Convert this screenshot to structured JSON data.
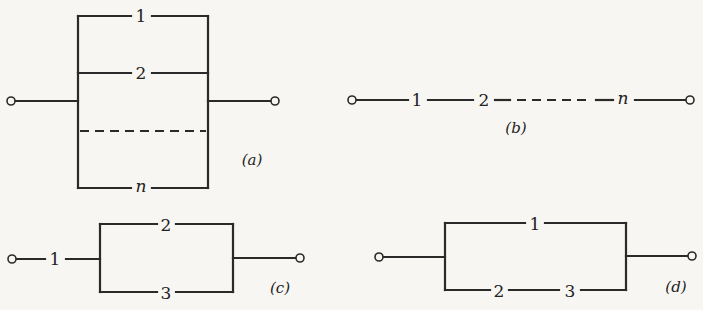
{
  "figure": {
    "panels": [
      {
        "id": "a",
        "caption": "(a)",
        "type": "parallel",
        "branches": [
          "1",
          "2",
          "dashed-continuation",
          "n"
        ]
      },
      {
        "id": "b",
        "caption": "(b)",
        "type": "series",
        "elements": [
          "1",
          "2",
          "dashed-continuation",
          "n"
        ]
      },
      {
        "id": "c",
        "caption": "(c)",
        "type": "series-parallel",
        "series_element": "1",
        "parallel_branches": [
          "2",
          "3"
        ]
      },
      {
        "id": "d",
        "caption": "(d)",
        "type": "parallel-series",
        "parallel_branches": [
          [
            "1"
          ],
          [
            "2",
            "3"
          ]
        ]
      }
    ]
  },
  "labels": {
    "a": {
      "b1": "1",
      "b2": "2",
      "bn": "n",
      "cap": "(a)"
    },
    "b": {
      "e1": "1",
      "e2": "2",
      "en": "n",
      "cap": "(b)"
    },
    "c": {
      "s1": "1",
      "p2": "2",
      "p3": "3",
      "cap": "(c)"
    },
    "d": {
      "p1": "1",
      "q2": "2",
      "q3": "3",
      "cap": "(d)"
    }
  },
  "colors": {
    "ink": "#2a2a2a",
    "paper": "#f7f6f2"
  }
}
